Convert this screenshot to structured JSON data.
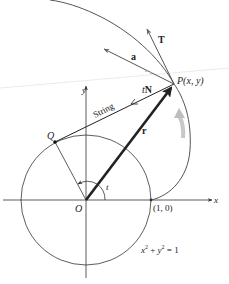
{
  "figure": {
    "type": "involute-of-circle diagram",
    "labels": {
      "point_P": "P(x, y)",
      "point_Q": "Q",
      "origin": "O",
      "point_1_0": "(1, 0)",
      "axis_x": "x",
      "axis_y": "y",
      "angle": "t",
      "string": "String",
      "vector_T": "T",
      "vector_a": "a",
      "vector_tN_t": "t",
      "vector_tN_N": "N",
      "vector_r": "r",
      "equation_x": "x",
      "equation_plus": " + ",
      "equation_y": "y",
      "equation_eq": " = 1",
      "sup2": "2"
    },
    "colors": {
      "ink": "#222222",
      "curve": "#555555",
      "gray_arrow": "#bdbdbd",
      "background": "#ffffff"
    }
  }
}
